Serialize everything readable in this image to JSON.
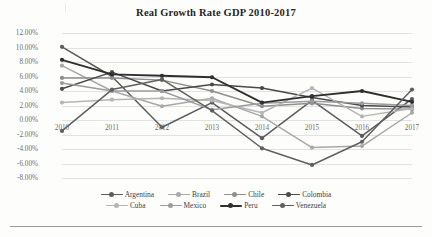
{
  "chart_data": {
    "type": "line",
    "title": "Real Growth Rate GDP 2010-2017",
    "xlabel": "",
    "ylabel": "",
    "ylim": [
      -8,
      12
    ],
    "ytick_labels": [
      "12.00%",
      "10.00%",
      "8.00%",
      "6.00%",
      "4.00%",
      "2.00%",
      "0.00%",
      "-2.00%",
      "-4.00%",
      "-6.00%",
      "-8.00%"
    ],
    "ytick_values": [
      12,
      10,
      8,
      6,
      4,
      2,
      0,
      -2,
      -4,
      -6,
      -8
    ],
    "grid": true,
    "legend_position": "bottom",
    "x": [
      "2010",
      "2011",
      "2012",
      "2013",
      "2014",
      "2015",
      "2016",
      "2017"
    ],
    "categories": [
      "2010",
      "2011",
      "2012",
      "2013",
      "2014",
      "2015",
      "2016",
      "2017"
    ],
    "series": [
      {
        "name": "Argentina",
        "color": "#5c5c5c",
        "values": [
          10.1,
          6.0,
          -1.0,
          2.4,
          -2.5,
          2.7,
          -2.2,
          2.9
        ]
      },
      {
        "name": "Brazil",
        "color": "#a8a8a8",
        "values": [
          7.5,
          4.0,
          1.9,
          3.0,
          0.5,
          -3.8,
          -3.6,
          1.0
        ]
      },
      {
        "name": "Chile",
        "color": "#8f8f8f",
        "values": [
          5.8,
          5.8,
          5.5,
          4.0,
          1.9,
          2.3,
          1.6,
          1.5
        ]
      },
      {
        "name": "Colombia",
        "color": "#4a4a4a",
        "values": [
          4.3,
          6.6,
          4.0,
          4.9,
          4.4,
          3.1,
          2.0,
          1.8
        ]
      },
      {
        "name": "Cuba",
        "color": "#b5b5b5",
        "values": [
          2.4,
          2.8,
          3.0,
          2.7,
          1.0,
          4.4,
          0.5,
          1.6
        ]
      },
      {
        "name": "Mexico",
        "color": "#9c9c9c",
        "values": [
          5.1,
          4.0,
          4.0,
          1.4,
          2.3,
          2.6,
          2.3,
          2.0
        ]
      },
      {
        "name": "Peru",
        "color": "#2f2f2f",
        "values": [
          8.3,
          6.3,
          6.1,
          5.9,
          2.4,
          3.3,
          4.0,
          2.5
        ]
      },
      {
        "name": "Venezuela",
        "color": "#606060",
        "values": [
          -1.5,
          4.2,
          5.6,
          1.3,
          -3.9,
          -6.2,
          -3.0,
          4.2
        ]
      }
    ]
  },
  "legend": {
    "row1": [
      "Argentina",
      "Brazil",
      "Chile",
      "Colombia"
    ],
    "row2": [
      "Cuba",
      "Mexico",
      "Peru",
      "Venezuela"
    ]
  }
}
